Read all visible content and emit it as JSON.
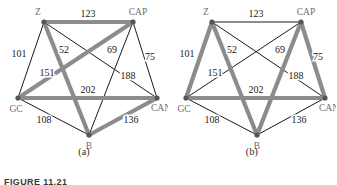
{
  "figure": {
    "number_text": "FIGURE 11.21",
    "panels": [
      {
        "id": "a",
        "caption": "(a)"
      },
      {
        "id": "b",
        "caption": "(b)"
      }
    ]
  },
  "colors": {
    "highlight_edge": "#8c8c8c",
    "normal_edge": "#1a1a1a",
    "vertex": "#555555",
    "node_label": "#6e6e6e",
    "weight_label": "#222222",
    "background": "#ffffff"
  },
  "graph": {
    "nodes": [
      {
        "id": "Z",
        "label": "Z",
        "x": 44,
        "y": 22,
        "label_dx": -6,
        "label_dy": -7,
        "anchor": "middle"
      },
      {
        "id": "CAP",
        "label": "CAP",
        "x": 133,
        "y": 22,
        "label_dx": 5,
        "label_dy": -7,
        "anchor": "middle"
      },
      {
        "id": "CAN",
        "label": "CAN",
        "x": 157,
        "y": 98,
        "label_dx": 4,
        "label_dy": 13,
        "anchor": "middle"
      },
      {
        "id": "B",
        "label": "B",
        "x": 89,
        "y": 135,
        "label_dx": 0,
        "label_dy": 14,
        "anchor": "middle"
      },
      {
        "id": "GC",
        "label": "GC",
        "x": 18,
        "y": 98,
        "label_dx": -2,
        "label_dy": 14,
        "anchor": "middle"
      }
    ],
    "edges": [
      {
        "id": "Z-CAP",
        "from": "Z",
        "to": "CAP",
        "weight": 123,
        "label_x": 88,
        "label_y": 17
      },
      {
        "id": "Z-GC",
        "from": "Z",
        "to": "GC",
        "weight": 101,
        "label_x": 19,
        "label_y": 57
      },
      {
        "id": "Z-B",
        "from": "Z",
        "to": "B",
        "weight": 151,
        "label_x": 47,
        "label_y": 76
      },
      {
        "id": "Z-CAN",
        "from": "Z",
        "to": "CAN",
        "weight": 52,
        "label_x": 64,
        "label_y": 53
      },
      {
        "id": "CAP-GC",
        "from": "CAP",
        "to": "GC",
        "weight": 69,
        "label_x": 112,
        "label_y": 53
      },
      {
        "id": "CAP-CAN",
        "from": "CAP",
        "to": "CAN",
        "weight": 75,
        "label_x": 150,
        "label_y": 60
      },
      {
        "id": "CAP-B",
        "from": "CAP",
        "to": "B",
        "weight": 188,
        "label_x": 128,
        "label_y": 79
      },
      {
        "id": "GC-CAN",
        "from": "GC",
        "to": "CAN",
        "weight": 202,
        "label_x": 88,
        "label_y": 93
      },
      {
        "id": "GC-B",
        "from": "GC",
        "to": "B",
        "weight": 108,
        "label_x": 44,
        "label_y": 123
      },
      {
        "id": "CAN-B",
        "from": "CAN",
        "to": "B",
        "weight": 136,
        "label_x": 131,
        "label_y": 123
      }
    ]
  },
  "panel_a": {
    "caption": "(a)",
    "highlighted_edges": [
      "Z-CAP",
      "Z-B",
      "CAP-GC",
      "GC-CAN",
      "CAN-B"
    ],
    "normal_edges": [
      "Z-GC",
      "Z-CAN",
      "CAP-CAN",
      "CAP-B",
      "GC-B"
    ]
  },
  "panel_b": {
    "caption": "(b)",
    "highlighted_edges": [
      "Z-GC",
      "Z-B",
      "CAP-CAN",
      "CAP-B",
      "GC-CAN"
    ],
    "normal_edges": [
      "Z-CAP",
      "Z-CAN",
      "CAP-GC",
      "GC-B",
      "CAN-B"
    ]
  }
}
